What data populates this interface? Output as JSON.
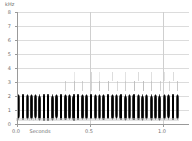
{
  "figure": {
    "kind": "spectrogram",
    "background": "#ffffff",
    "width": 192,
    "height": 141
  },
  "axes": {
    "y_unit_label": "kHz",
    "y_ticks": [
      "8",
      "7",
      "6",
      "5",
      "4",
      "3",
      "2",
      "1",
      "0"
    ],
    "y_min": 0,
    "y_max": 8,
    "x_label": "Seconds",
    "x_ticks": [
      "0.0",
      "0.5",
      "1.0"
    ],
    "x_min": 0.0,
    "x_max": 1.18,
    "grid": "on",
    "axis_color": "#9a9a9a",
    "grid_color": "#dcdcdc",
    "tick_text_color": "#6e6e6e"
  },
  "chart_data": {
    "type": "heatmap",
    "title": "",
    "xlabel": "Seconds",
    "ylabel": "kHz",
    "xlim": [
      0.0,
      1.18
    ],
    "ylim": [
      0,
      8
    ],
    "grid": "on",
    "legend": "none",
    "series": [
      {
        "name": "main-pulse-train",
        "band_khz": [
          0.35,
          2.05
        ],
        "intensity": "high",
        "color": "#1b1b1b",
        "times_s": [
          0.015,
          0.045,
          0.074,
          0.102,
          0.131,
          0.159,
          0.188,
          0.216,
          0.246,
          0.275,
          0.304,
          0.333,
          0.362,
          0.392,
          0.421,
          0.45,
          0.479,
          0.509,
          0.538,
          0.567,
          0.597,
          0.626,
          0.655,
          0.685,
          0.714,
          0.744,
          0.773,
          0.803,
          0.832,
          0.862,
          0.891,
          0.921,
          0.951,
          0.98,
          1.01,
          1.04,
          1.07,
          1.1
        ]
      },
      {
        "name": "upper-harmonic-trace",
        "band_khz": [
          2.35,
          3.05
        ],
        "intensity": "faint",
        "color": "#b9b9b9",
        "times_s": [
          0.33,
          0.392,
          0.45,
          0.509,
          0.567,
          0.626,
          0.685,
          0.744,
          0.803,
          0.862,
          0.921,
          0.98,
          1.04,
          1.1
        ]
      },
      {
        "name": "secondary-harmonic-trace",
        "band_khz": [
          3.1,
          3.7
        ],
        "intensity": "very-faint",
        "color": "#d2d2d2",
        "times_s": [
          0.392,
          0.509,
          0.567,
          0.655,
          0.744,
          0.832,
          0.921,
          1.01,
          1.07
        ]
      }
    ]
  }
}
